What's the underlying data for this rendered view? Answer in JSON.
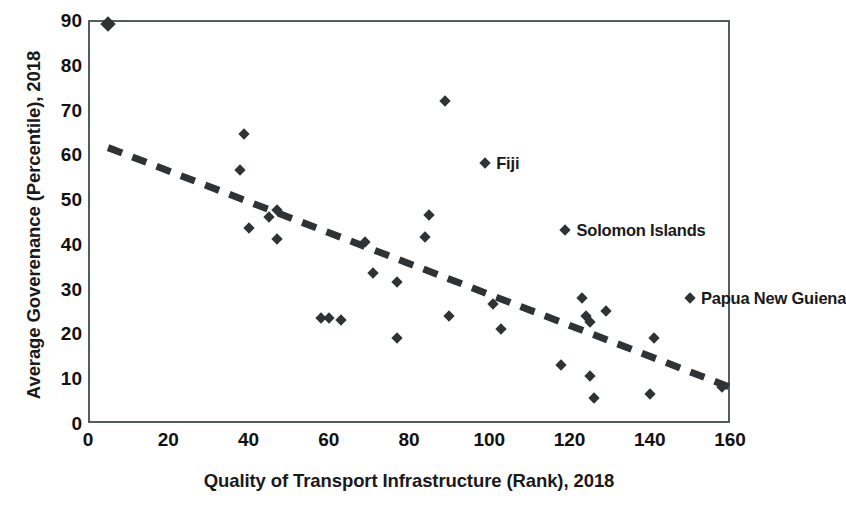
{
  "chart_data": {
    "type": "scatter",
    "title": "",
    "xlabel": "Quality of Transport Infrastructure (Rank), 2018",
    "ylabel": "Average Goverenance (Percentile), 2018",
    "xlim": [
      0,
      160
    ],
    "ylim": [
      0,
      90
    ],
    "xticks": [
      "0",
      "20",
      "40",
      "60",
      "80",
      "100",
      "120",
      "140",
      "160"
    ],
    "yticks": [
      "0",
      "10",
      "20",
      "30",
      "40",
      "50",
      "60",
      "70",
      "80",
      "90"
    ],
    "xtick_values": [
      0,
      20,
      40,
      60,
      80,
      100,
      120,
      140,
      160
    ],
    "ytick_values": [
      0,
      10,
      20,
      30,
      40,
      50,
      60,
      70,
      80,
      90
    ],
    "grid": false,
    "legend": "none",
    "marker_color": "#2f3335",
    "marker_shape": "diamond",
    "points": [
      {
        "x": 5,
        "y": 89
      },
      {
        "x": 39,
        "y": 64.5
      },
      {
        "x": 38,
        "y": 56.5
      },
      {
        "x": 40,
        "y": 43.5
      },
      {
        "x": 45,
        "y": 46
      },
      {
        "x": 47,
        "y": 47.5
      },
      {
        "x": 47,
        "y": 41
      },
      {
        "x": 58,
        "y": 23.5
      },
      {
        "x": 60,
        "y": 23.5
      },
      {
        "x": 63,
        "y": 23
      },
      {
        "x": 69,
        "y": 40.5
      },
      {
        "x": 71,
        "y": 33.5
      },
      {
        "x": 77,
        "y": 31.5
      },
      {
        "x": 77,
        "y": 19
      },
      {
        "x": 84,
        "y": 41.5
      },
      {
        "x": 85,
        "y": 46.5
      },
      {
        "x": 89,
        "y": 72
      },
      {
        "x": 90,
        "y": 24
      },
      {
        "x": 101,
        "y": 26.5
      },
      {
        "x": 103,
        "y": 21
      },
      {
        "x": 118,
        "y": 13
      },
      {
        "x": 123,
        "y": 28
      },
      {
        "x": 124,
        "y": 24
      },
      {
        "x": 125,
        "y": 22.5
      },
      {
        "x": 125,
        "y": 10.5
      },
      {
        "x": 126,
        "y": 5.5
      },
      {
        "x": 129,
        "y": 25
      },
      {
        "x": 141,
        "y": 19
      },
      {
        "x": 140,
        "y": 6.5
      },
      {
        "x": 158,
        "y": 8
      }
    ],
    "labeled_points": [
      {
        "label": "Fiji",
        "x": 99,
        "y": 58
      },
      {
        "label": "Solomon Islands",
        "x": 119,
        "y": 43
      },
      {
        "label": "Papua New Guiena",
        "x": 150,
        "y": 28
      }
    ],
    "trendline": {
      "style": "dashed",
      "color": "#2f3335",
      "x0": 5,
      "y0": 61.5,
      "x1": 160,
      "y1": 8
    }
  }
}
